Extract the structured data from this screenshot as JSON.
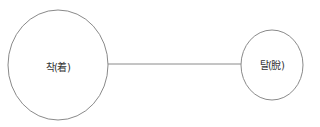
{
  "diagram": {
    "type": "two-node relation",
    "stroke_color": "#8a8a8a",
    "text_color": "#333333",
    "nodes": [
      {
        "id": "left",
        "label": "착(着)",
        "cx": 58,
        "cy": 65,
        "rx": 50,
        "ry": 55
      },
      {
        "id": "right",
        "label": "탈(脫)",
        "cx": 272,
        "cy": 65,
        "rx": 31,
        "ry": 35
      }
    ],
    "edges": [
      {
        "from": "left",
        "to": "right",
        "x1": 108,
        "y1": 64,
        "x2": 241,
        "y2": 64
      }
    ]
  }
}
